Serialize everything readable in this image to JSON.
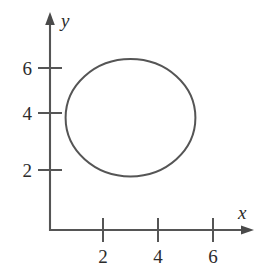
{
  "figure": {
    "kind": "coordinate-plane-with-closed-curve",
    "background_color": "#ffffff",
    "ink_color": "#555555",
    "text_color": "#2b2b2b"
  },
  "axes": {
    "x": {
      "label": "x",
      "ticks": [
        "2",
        "4",
        "6"
      ],
      "tick_values": [
        2,
        4,
        6
      ],
      "arrow": "right-arrow-icon"
    },
    "y": {
      "label": "y",
      "ticks": [
        "6",
        "4",
        "2"
      ],
      "tick_values": [
        6,
        4,
        2
      ],
      "arrow": "up-arrow-icon"
    }
  },
  "chart_data": {
    "type": "line",
    "title": "",
    "xlabel": "x",
    "ylabel": "y",
    "xlim": [
      0,
      7.3
    ],
    "ylim": [
      0,
      9.6
    ],
    "grid": false,
    "legend": "none",
    "xticks": [
      2,
      4,
      6
    ],
    "yticks": [
      2,
      4,
      6
    ],
    "annotations": [],
    "series": [
      {
        "name": "ellipse",
        "shape": "ellipse",
        "center": [
          3.0,
          4.05
        ],
        "rx": 2.36,
        "ry": 2.3,
        "closed": true,
        "stroke": "#555555",
        "fill": "none"
      }
    ]
  }
}
